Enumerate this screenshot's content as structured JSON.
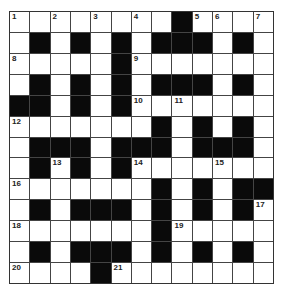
{
  "puzzle": {
    "type": "crossword",
    "rows": 13,
    "cols": 13,
    "colors": {
      "white_cell": "#ffffff",
      "black_cell": "#0a0a0a",
      "grid_line": "#444444"
    },
    "layout": [
      "WWWWWWWWBWWWW",
      "WBWBWBWBBBWBW",
      "WWWWWBWWWWWWW",
      "WBWBWBWBBBWBW",
      "BBWBWBWWWWWWW",
      "WWWWWWWBWBWBW",
      "WBBBWBBBWBBBW",
      "WBWBWBWWWWWWW",
      "WWWWWWWBWBWBB",
      "WBWBBBWBWBWBW",
      "WWWWWWWBWWWWW",
      "WBWBBBWBWBWBW",
      "WWWWBWWWWWWWW"
    ],
    "numbers": [
      {
        "row": 0,
        "col": 0,
        "n": "1"
      },
      {
        "row": 0,
        "col": 2,
        "n": "2"
      },
      {
        "row": 0,
        "col": 4,
        "n": "3"
      },
      {
        "row": 0,
        "col": 6,
        "n": "4"
      },
      {
        "row": 0,
        "col": 9,
        "n": "5"
      },
      {
        "row": 0,
        "col": 10,
        "n": "6"
      },
      {
        "row": 0,
        "col": 12,
        "n": "7"
      },
      {
        "row": 2,
        "col": 0,
        "n": "8"
      },
      {
        "row": 2,
        "col": 6,
        "n": "9"
      },
      {
        "row": 4,
        "col": 6,
        "n": "10"
      },
      {
        "row": 4,
        "col": 8,
        "n": "11"
      },
      {
        "row": 5,
        "col": 0,
        "n": "12"
      },
      {
        "row": 7,
        "col": 2,
        "n": "13"
      },
      {
        "row": 7,
        "col": 6,
        "n": "14"
      },
      {
        "row": 7,
        "col": 10,
        "n": "15"
      },
      {
        "row": 8,
        "col": 0,
        "n": "16"
      },
      {
        "row": 9,
        "col": 12,
        "n": "17"
      },
      {
        "row": 10,
        "col": 0,
        "n": "18"
      },
      {
        "row": 10,
        "col": 8,
        "n": "19"
      },
      {
        "row": 12,
        "col": 0,
        "n": "20"
      },
      {
        "row": 12,
        "col": 5,
        "n": "21"
      }
    ]
  }
}
